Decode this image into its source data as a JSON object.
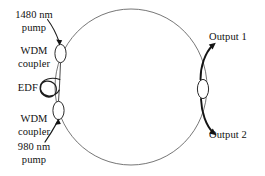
{
  "figure": {
    "type": "schematic-diagram",
    "background_color": "#ffffff",
    "line_color": "#555555",
    "component_color": "#222222",
    "text_color": "#111111"
  },
  "labels": {
    "pump_1480_line1": "1480 nm",
    "pump_1480_line2": "pump",
    "wdm_top_line1": "WDM",
    "wdm_top_line2": "coupler",
    "edf": "EDF",
    "wdm_bottom_line1": "WDM",
    "wdm_bottom_line2": "coupler",
    "pump_980_line1": "980 nm",
    "pump_980_line2": "pump",
    "output_1": "Output 1",
    "output_2": "Output 2"
  },
  "components": {
    "ring": {
      "name": "fiber-ring-cavity",
      "cx": 131,
      "cy": 87,
      "rx": 76,
      "ry": 78
    },
    "wdm_coupler_top": {
      "name": "wdm-coupler-top",
      "cx": 60.5,
      "cy": 53.5,
      "rx": 5.5,
      "ry": 9
    },
    "wdm_coupler_bottom": {
      "name": "wdm-coupler-bottom",
      "cx": 58.5,
      "cy": 110.5,
      "rx": 5.5,
      "ry": 9
    },
    "edf_coil": {
      "name": "edf-fiber-coil",
      "cx": 47,
      "cy": 88,
      "r": 9,
      "turns": 2
    },
    "output_coupler": {
      "name": "output-coupler",
      "cx": 203,
      "cy": 89,
      "rx": 5.5,
      "ry": 9.5
    }
  },
  "arrows": {
    "pump_1480_in": "arrow pointing down-right into top WDM coupler",
    "pump_980_in": "arrow pointing up-right into bottom WDM coupler",
    "output_1_out": "arrow pointing up-right away from output coupler",
    "output_2_out": "arrow pointing down-right away from output coupler"
  }
}
